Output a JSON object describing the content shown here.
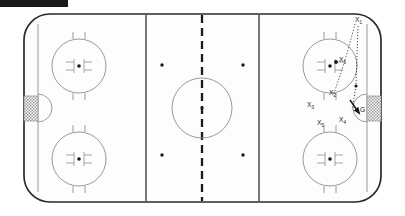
{
  "diagram": {
    "surface_color": "#fdfdfd",
    "board_color": "#2b2b2b",
    "line_color": "#8c8c99",
    "mark_color": "#1a1a1a",
    "net_color": "#8f8f8f"
  },
  "topbar": {
    "color": "#1a1a1a"
  },
  "rink": {
    "boards": {
      "x": 24,
      "y": 14,
      "width": 357,
      "height": 188,
      "radius": 26
    },
    "blue_lines": [
      {
        "name": "left-blue-line",
        "x": 146
      },
      {
        "name": "right-blue-line",
        "x": 259
      }
    ],
    "center_line": {
      "name": "center-red-line",
      "x": 202,
      "dashed": true
    },
    "goal_lines": [
      {
        "name": "left-goal-line",
        "x": 38
      },
      {
        "name": "right-goal-line",
        "x": 367
      }
    ],
    "center_circle": {
      "cx": 202,
      "cy": 108,
      "r": 30
    },
    "center_dot": {
      "cx": 202,
      "cy": 108
    },
    "neutral_dots": [
      {
        "cx": 162,
        "cy": 65
      },
      {
        "cx": 243,
        "cy": 65
      },
      {
        "cx": 162,
        "cy": 155
      },
      {
        "cx": 243,
        "cy": 155
      }
    ],
    "faceoff_circles": [
      {
        "name": "faceoff-circle-left-top",
        "cx": 79,
        "cy": 66,
        "r": 27
      },
      {
        "name": "faceoff-circle-left-bottom",
        "cx": 79,
        "cy": 159,
        "r": 27
      },
      {
        "name": "faceoff-circle-right-top",
        "cx": 330,
        "cy": 66,
        "r": 27
      },
      {
        "name": "faceoff-circle-right-bottom",
        "cx": 330,
        "cy": 159,
        "r": 27
      }
    ],
    "creases": [
      {
        "name": "left-crease",
        "cx": 38,
        "cy": 108,
        "r": 14,
        "side": "right"
      },
      {
        "name": "right-crease",
        "cx": 367,
        "cy": 108,
        "r": 14,
        "side": "left"
      }
    ],
    "nets": [
      {
        "name": "left-net",
        "x": 24,
        "y": 96,
        "width": 14,
        "height": 25
      },
      {
        "name": "right-net",
        "x": 367,
        "y": 96,
        "width": 14,
        "height": 25
      }
    ]
  },
  "players": [
    {
      "id": "x1",
      "label": "X",
      "sub": "1",
      "x": 357,
      "y": 20,
      "dot": false,
      "dot_x": 0,
      "dot_y": 0
    },
    {
      "id": "x5_top",
      "label": "X",
      "sub": "5",
      "x": 340,
      "y": 60,
      "dot": true,
      "dot_x": 336,
      "dot_y": 62
    },
    {
      "id": "x2",
      "label": "X",
      "sub": "2",
      "x": 331,
      "y": 94,
      "dot": true,
      "dot_x": 356,
      "dot_y": 86
    },
    {
      "id": "x3",
      "label": "X",
      "sub": "3",
      "x": 309,
      "y": 106,
      "dot": false,
      "dot_x": 0,
      "dot_y": 0
    },
    {
      "id": "x4",
      "label": "X",
      "sub": "4",
      "x": 340,
      "y": 121,
      "dot": false,
      "dot_x": 0,
      "dot_y": 0
    },
    {
      "id": "x5_bottom",
      "label": "X",
      "sub": "5",
      "x": 319,
      "y": 124,
      "dot": false,
      "dot_x": 0,
      "dot_y": 0
    }
  ],
  "goalie": {
    "id": "g",
    "label": "G",
    "x": 362,
    "y": 110
  },
  "movement": {
    "paths": [
      {
        "name": "pass-path-upper",
        "d": "M 355 24 L 348 50 L 340 76 L 333 96"
      },
      {
        "name": "pass-path-lower",
        "d": "M 358 26 L 357 56 L 356 86 L 352 110"
      }
    ],
    "arrow": {
      "name": "shot-arrow",
      "from_x": 351,
      "from_y": 101,
      "to_x": 359,
      "to_y": 113
    }
  }
}
